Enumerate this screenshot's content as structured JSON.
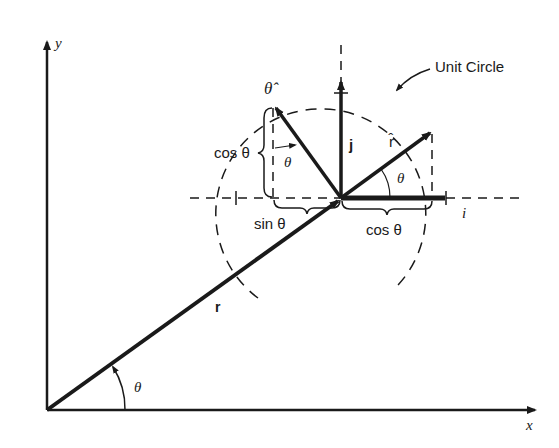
{
  "diagram": {
    "type": "polar unit vectors diagram",
    "axes": {
      "x_label": "x",
      "y_label": "y"
    },
    "labels": {
      "unit_circle": "Unit Circle",
      "r_hat": "r̂",
      "theta_hat": "θ̂",
      "j": "j",
      "i": "i",
      "r": "r",
      "theta_origin": "θ",
      "theta_rhat": "θ",
      "theta_thetahat": "θ",
      "cos_theta_vertical": "cos θ",
      "cos_theta_horizontal": "cos θ",
      "sin_theta": "sin θ"
    },
    "colors": {
      "ink": "#1a1a1a",
      "background": "#ffffff"
    }
  }
}
